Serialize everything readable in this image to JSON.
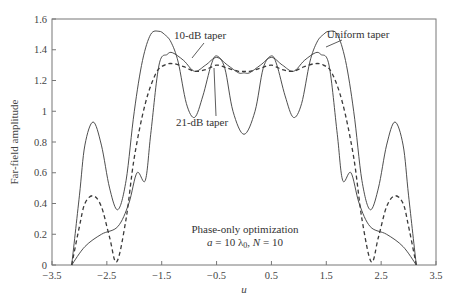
{
  "chart_data": {
    "type": "line",
    "title": "",
    "xlabel": "u",
    "ylabel": "Far-field amplitude",
    "xlim": [
      -3.5,
      3.5
    ],
    "ylim": [
      0,
      1.6
    ],
    "xticks": [
      "-3.5",
      "-2.5",
      "-1.5",
      "-0.5",
      "0.5",
      "1.5",
      "2.5",
      "3.5"
    ],
    "yticks": [
      "0",
      "0.2",
      "0.4",
      "0.6",
      "0.8",
      "1",
      "1.2",
      "1.4",
      "1.6"
    ],
    "grid": false,
    "legend": "inline labels with arrows",
    "series": [
      {
        "name": "Uniform taper",
        "style": "solid",
        "x": [
          -3.14,
          -3.0,
          -2.9,
          -2.75,
          -2.6,
          -2.45,
          -2.3,
          -2.15,
          -2.0,
          -1.85,
          -1.7,
          -1.55,
          -1.45,
          -1.33,
          -1.2,
          -1.05,
          -0.9,
          -0.75,
          -0.6,
          -0.5,
          -0.35,
          -0.2,
          0.0,
          0.2,
          0.35,
          0.5,
          0.6,
          0.75,
          0.9,
          1.05,
          1.2,
          1.33,
          1.45,
          1.55,
          1.7,
          1.85,
          2.0,
          2.15,
          2.3,
          2.45,
          2.6,
          2.75,
          2.9,
          3.0,
          3.14
        ],
        "values": [
          0.0,
          0.45,
          0.78,
          0.93,
          0.78,
          0.5,
          0.36,
          0.55,
          1.0,
          1.33,
          1.5,
          1.52,
          1.5,
          1.45,
          1.32,
          1.05,
          0.96,
          1.1,
          1.3,
          1.36,
          1.28,
          1.0,
          0.85,
          1.0,
          1.28,
          1.36,
          1.3,
          1.1,
          0.96,
          1.05,
          1.32,
          1.45,
          1.5,
          1.52,
          1.5,
          1.33,
          1.0,
          0.55,
          0.36,
          0.5,
          0.78,
          0.93,
          0.78,
          0.45,
          0.0
        ]
      },
      {
        "name": "10-dB taper",
        "style": "solid",
        "x": [
          -3.14,
          -2.9,
          -2.6,
          -2.3,
          -2.1,
          -1.95,
          -1.8,
          -1.7,
          -1.55,
          -1.4,
          -1.3,
          -1.1,
          -0.9,
          -0.7,
          -0.5,
          -0.3,
          -0.1,
          0.0,
          0.1,
          0.3,
          0.5,
          0.7,
          0.9,
          1.1,
          1.3,
          1.4,
          1.55,
          1.7,
          1.8,
          1.95,
          2.1,
          2.3,
          2.6,
          2.9,
          3.14
        ],
        "values": [
          0.0,
          0.12,
          0.2,
          0.25,
          0.4,
          0.6,
          0.55,
          0.85,
          1.3,
          1.37,
          1.38,
          1.33,
          1.26,
          1.3,
          1.35,
          1.3,
          1.25,
          1.25,
          1.25,
          1.3,
          1.35,
          1.3,
          1.26,
          1.33,
          1.38,
          1.37,
          1.3,
          0.85,
          0.55,
          0.6,
          0.4,
          0.25,
          0.2,
          0.12,
          0.0
        ]
      },
      {
        "name": "21-dB taper",
        "style": "dashed",
        "x": [
          -3.14,
          -3.0,
          -2.9,
          -2.75,
          -2.6,
          -2.45,
          -2.32,
          -2.15,
          -2.0,
          -1.8,
          -1.6,
          -1.45,
          -1.3,
          -1.1,
          -0.9,
          -0.7,
          -0.5,
          -0.3,
          -0.1,
          0.0,
          0.1,
          0.3,
          0.5,
          0.7,
          0.9,
          1.1,
          1.3,
          1.45,
          1.6,
          1.8,
          2.0,
          2.15,
          2.32,
          2.45,
          2.6,
          2.75,
          2.9,
          3.0,
          3.14
        ],
        "values": [
          0.0,
          0.25,
          0.4,
          0.45,
          0.38,
          0.18,
          0.02,
          0.3,
          0.7,
          1.05,
          1.25,
          1.3,
          1.31,
          1.29,
          1.26,
          1.27,
          1.3,
          1.28,
          1.26,
          1.26,
          1.26,
          1.28,
          1.3,
          1.27,
          1.26,
          1.29,
          1.31,
          1.3,
          1.25,
          1.05,
          0.7,
          0.3,
          0.02,
          0.18,
          0.38,
          0.45,
          0.4,
          0.25,
          0.0
        ]
      }
    ],
    "annotations": [
      {
        "text": "10-dB taper",
        "x": -0.1,
        "y": 1.49
      },
      {
        "text": "Uniform taper",
        "x": 2.1,
        "y": 1.5
      },
      {
        "text": "21-dB taper",
        "x": -0.1,
        "y": 1.02
      },
      {
        "text": "Phase-only optimization",
        "x": 0.1,
        "y": 0.27
      },
      {
        "text": "a = 10 λ0, N = 10",
        "x": 0.1,
        "y": 0.17
      }
    ]
  },
  "labels": {
    "ylabel": "Far-field amplitude",
    "xlabel": "u",
    "label_10db": "10-dB taper",
    "label_uniform": "Uniform taper",
    "label_21db": "21-dB taper",
    "note_line1": "Phase-only optimization",
    "note_line2_a": "a",
    "note_line2_rest": " = 10 λ",
    "note_line2_sub": "0",
    "note_line2_n": ", N",
    "note_line2_end": " = 10"
  }
}
